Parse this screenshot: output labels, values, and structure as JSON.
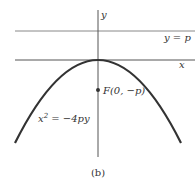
{
  "figure": {
    "caption": "(b)",
    "axes": {
      "x_label": "x",
      "y_label": "y"
    },
    "directrix_label": "y = p",
    "focus_label": "F(0, −p)",
    "equation": {
      "base": "x",
      "exp": "2",
      "rest": " = −4py"
    },
    "colors": {
      "curve": "#333333",
      "axis": "#555555",
      "line": "#888888",
      "text": "#333333"
    }
  }
}
